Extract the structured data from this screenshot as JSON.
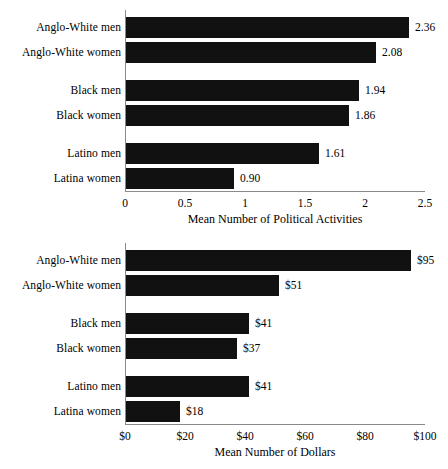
{
  "chart_data": [
    {
      "id": "political-activities",
      "type": "bar",
      "orientation": "horizontal",
      "title": "",
      "xlabel": "Mean Number of Political Activities",
      "ylabel": "",
      "xlim": [
        0,
        2.5
      ],
      "xticks": [
        "0",
        "0.5",
        "1",
        "1.5",
        "2",
        "2.5"
      ],
      "xtick_values": [
        0,
        0.5,
        1,
        1.5,
        2,
        2.5
      ],
      "grid": false,
      "legend": "none",
      "bar_color": "#111111",
      "axis_color": "#8a8a8a",
      "categories": [
        "Anglo-White men",
        "Anglo-White women",
        "Black men",
        "Black women",
        "Latino men",
        "Latina women"
      ],
      "values": [
        2.36,
        2.08,
        1.94,
        1.86,
        1.61,
        0.9
      ],
      "value_labels": [
        "2.36",
        "2.08",
        "1.94",
        "1.86",
        "1.61",
        "0.90"
      ],
      "group_breaks": [
        2,
        4
      ]
    },
    {
      "id": "dollars",
      "type": "bar",
      "orientation": "horizontal",
      "title": "",
      "xlabel": "Mean Number of Dollars",
      "ylabel": "",
      "xlim": [
        0,
        100
      ],
      "xticks": [
        "$0",
        "$20",
        "$40",
        "$60",
        "$80",
        "$100"
      ],
      "xtick_values": [
        0,
        20,
        40,
        60,
        80,
        100
      ],
      "grid": false,
      "legend": "none",
      "bar_color": "#111111",
      "axis_color": "#8a8a8a",
      "categories": [
        "Anglo-White men",
        "Anglo-White women",
        "Black men",
        "Black women",
        "Latino men",
        "Latina women"
      ],
      "values": [
        95,
        51,
        41,
        37,
        41,
        18
      ],
      "value_labels": [
        "$95",
        "$51",
        "$41",
        "$37",
        "$41",
        "$18"
      ],
      "group_breaks": [
        2,
        4
      ]
    }
  ]
}
